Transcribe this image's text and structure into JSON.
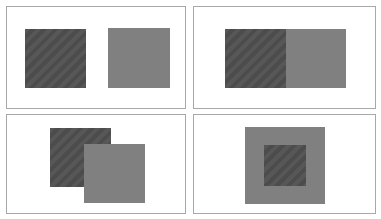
{
  "colors": {
    "dark": "#505050",
    "gray": "#808080",
    "border": "#a8a8a8",
    "background": "#ffffff"
  },
  "panels": [
    {
      "id": "separated",
      "box": {
        "left": 6,
        "top": 6,
        "width": 180,
        "height": 103
      },
      "squares": [
        {
          "tone": "dark",
          "left": 18,
          "top": 22,
          "width": 61,
          "height": 59
        },
        {
          "tone": "gray",
          "left": 101,
          "top": 21,
          "width": 62,
          "height": 60
        }
      ]
    },
    {
      "id": "adjacent",
      "box": {
        "left": 193,
        "top": 6,
        "width": 183,
        "height": 103
      },
      "squares": [
        {
          "tone": "dark",
          "left": 31,
          "top": 22,
          "width": 61,
          "height": 59
        },
        {
          "tone": "gray",
          "left": 92,
          "top": 22,
          "width": 60,
          "height": 59
        }
      ]
    },
    {
      "id": "overlapping",
      "box": {
        "left": 6,
        "top": 114,
        "width": 180,
        "height": 100
      },
      "squares": [
        {
          "tone": "dark",
          "left": 43,
          "top": 13,
          "width": 61,
          "height": 59
        },
        {
          "tone": "gray",
          "left": 77,
          "top": 29,
          "width": 61,
          "height": 59
        }
      ]
    },
    {
      "id": "nested",
      "box": {
        "left": 193,
        "top": 114,
        "width": 183,
        "height": 100
      },
      "squares": [
        {
          "tone": "gray",
          "left": 51,
          "top": 12,
          "width": 80,
          "height": 77
        },
        {
          "tone": "dark",
          "left": 70,
          "top": 30,
          "width": 42,
          "height": 41
        }
      ]
    }
  ]
}
